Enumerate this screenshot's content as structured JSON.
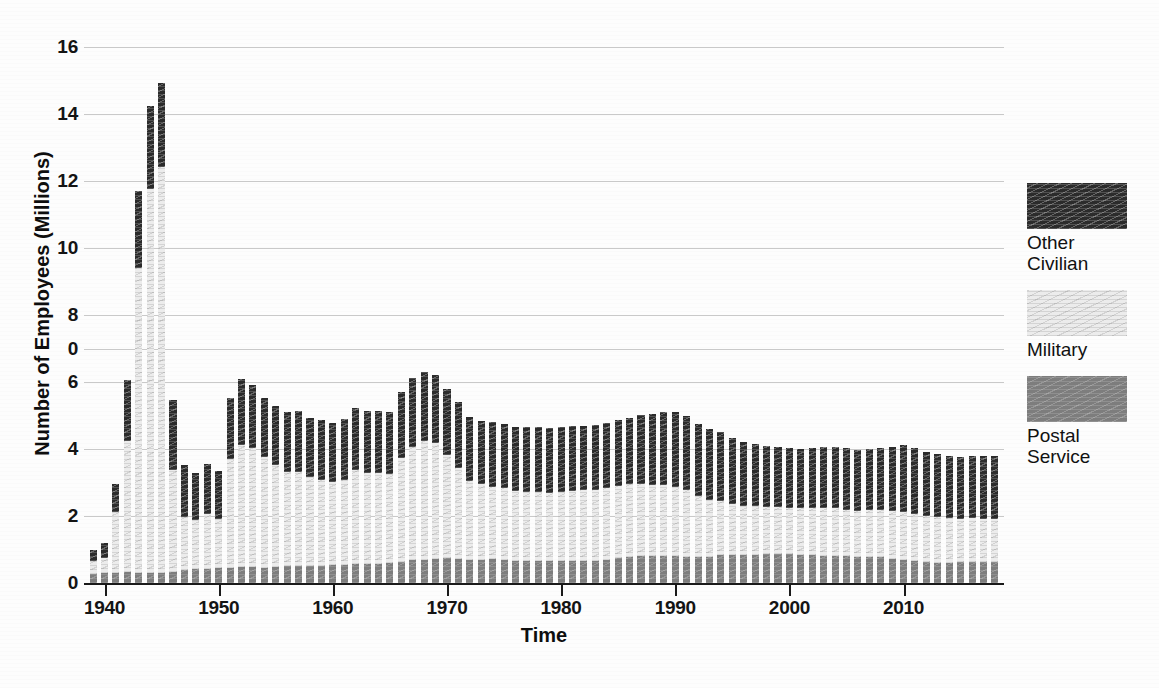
{
  "chart_data": {
    "type": "bar",
    "subtype": "stacked-vertical-bar",
    "title": "",
    "xlabel": "Time",
    "ylabel": "Number of Employees (Millions)",
    "xlim": [
      1938.2,
      2018.8
    ],
    "ylim": [
      0,
      16
    ],
    "grid": true,
    "grid_axis": "y",
    "legend_position": "right",
    "y_tick_labels": [
      "16",
      "14",
      "12",
      "10",
      "8",
      "0",
      "6",
      "4",
      "2",
      "0"
    ],
    "y_tick_values": [
      16,
      14,
      12,
      10,
      8,
      7,
      6,
      4,
      2,
      0
    ],
    "x_tick_labels": [
      "1940",
      "1950",
      "1960",
      "1970",
      "1980",
      "1990",
      "2000",
      "2010"
    ],
    "x_tick_values": [
      1940,
      1950,
      1960,
      1970,
      1980,
      1990,
      2000,
      2010
    ],
    "categories": [
      1939,
      1940,
      1941,
      1942,
      1943,
      1944,
      1945,
      1946,
      1947,
      1948,
      1949,
      1950,
      1951,
      1952,
      1953,
      1954,
      1955,
      1956,
      1957,
      1958,
      1959,
      1960,
      1961,
      1962,
      1963,
      1964,
      1965,
      1966,
      1967,
      1968,
      1969,
      1970,
      1971,
      1972,
      1973,
      1974,
      1975,
      1976,
      1977,
      1978,
      1979,
      1980,
      1981,
      1982,
      1983,
      1984,
      1985,
      1986,
      1987,
      1988,
      1989,
      1990,
      1991,
      1992,
      1993,
      1994,
      1995,
      1996,
      1997,
      1998,
      1999,
      2000,
      2001,
      2002,
      2003,
      2004,
      2005,
      2006,
      2007,
      2008,
      2009,
      2010,
      2011,
      2012,
      2013,
      2014,
      2015,
      2016,
      2017,
      2018
    ],
    "series": [
      {
        "name": "Postal Service",
        "color": "#7d7d7d",
        "values": [
          0.28,
          0.3,
          0.31,
          0.32,
          0.31,
          0.3,
          0.31,
          0.34,
          0.38,
          0.42,
          0.43,
          0.44,
          0.46,
          0.47,
          0.47,
          0.46,
          0.48,
          0.5,
          0.51,
          0.51,
          0.52,
          0.53,
          0.54,
          0.56,
          0.57,
          0.58,
          0.59,
          0.64,
          0.68,
          0.7,
          0.73,
          0.74,
          0.73,
          0.7,
          0.7,
          0.71,
          0.7,
          0.67,
          0.66,
          0.66,
          0.67,
          0.66,
          0.66,
          0.67,
          0.67,
          0.7,
          0.74,
          0.79,
          0.8,
          0.8,
          0.82,
          0.82,
          0.79,
          0.78,
          0.78,
          0.85,
          0.85,
          0.84,
          0.85,
          0.86,
          0.87,
          0.87,
          0.85,
          0.83,
          0.81,
          0.8,
          0.8,
          0.79,
          0.79,
          0.77,
          0.73,
          0.68,
          0.65,
          0.62,
          0.61,
          0.61,
          0.62,
          0.63,
          0.63,
          0.62
        ]
      },
      {
        "name": "Military",
        "color": "#ececec",
        "values": [
          0.37,
          0.46,
          1.8,
          3.92,
          9.09,
          11.45,
          12.12,
          3.03,
          1.59,
          1.45,
          1.62,
          1.46,
          3.25,
          3.64,
          3.56,
          3.3,
          3.04,
          2.81,
          2.8,
          2.64,
          2.55,
          2.48,
          2.52,
          2.81,
          2.7,
          2.69,
          2.66,
          3.09,
          3.38,
          3.55,
          3.46,
          3.07,
          2.71,
          2.33,
          2.25,
          2.16,
          2.13,
          2.08,
          2.07,
          2.06,
          2.03,
          2.05,
          2.08,
          2.11,
          2.12,
          2.14,
          2.15,
          2.17,
          2.17,
          2.13,
          2.12,
          2.04,
          1.99,
          1.81,
          1.7,
          1.61,
          1.52,
          1.47,
          1.44,
          1.41,
          1.39,
          1.38,
          1.38,
          1.41,
          1.43,
          1.43,
          1.39,
          1.37,
          1.38,
          1.4,
          1.42,
          1.43,
          1.42,
          1.39,
          1.37,
          1.33,
          1.3,
          1.3,
          1.29,
          1.29
        ]
      },
      {
        "name": "Other Civilian",
        "color": "#2b2b2b",
        "values": [
          0.33,
          0.42,
          0.85,
          1.81,
          2.31,
          2.48,
          2.5,
          2.09,
          1.55,
          1.42,
          1.5,
          1.44,
          1.82,
          1.99,
          1.89,
          1.76,
          1.77,
          1.8,
          1.81,
          1.79,
          1.8,
          1.78,
          1.83,
          1.84,
          1.86,
          1.85,
          1.84,
          1.96,
          2.05,
          2.05,
          2.02,
          1.98,
          1.96,
          1.92,
          1.9,
          1.93,
          1.92,
          1.9,
          1.93,
          1.95,
          1.93,
          1.96,
          1.94,
          1.9,
          1.92,
          1.95,
          1.98,
          1.98,
          2.05,
          2.12,
          2.16,
          2.25,
          2.21,
          2.17,
          2.11,
          2.05,
          1.95,
          1.89,
          1.87,
          1.82,
          1.8,
          1.78,
          1.76,
          1.8,
          1.82,
          1.83,
          1.83,
          1.82,
          1.82,
          1.85,
          1.92,
          2.0,
          1.95,
          1.9,
          1.86,
          1.85,
          1.85,
          1.87,
          1.87,
          1.88
        ]
      }
    ],
    "annotations": []
  },
  "axes": {
    "y_title": "Number of Employees (Millions)",
    "x_title": "Time"
  },
  "legend": {
    "entries": [
      {
        "label": "Other\nCivilian",
        "swatch": "dark-hatched-swatch",
        "color": "#2b2b2b"
      },
      {
        "label": "Military",
        "swatch": "light-hatched-swatch",
        "color": "#ececec"
      },
      {
        "label": "Postal\nService",
        "swatch": "gray-hatched-swatch",
        "color": "#7d7d7d"
      }
    ]
  }
}
